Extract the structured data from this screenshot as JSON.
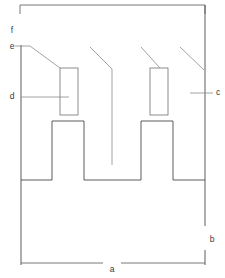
{
  "figure": {
    "type": "engineering-cross-section",
    "canvas": {
      "width": 225,
      "height": 278,
      "background": "#ffffff"
    },
    "line_color": "#4a4a4a",
    "leader_color": "#8a8a8a",
    "dimension_color": "#6a6a6a"
  },
  "labels": {
    "a": {
      "text": "a",
      "x": 112,
      "y": 270,
      "refers_to": "overall-width-dimension"
    },
    "b": {
      "text": "b",
      "x": 212,
      "y": 240,
      "refers_to": "overall-height-dimension"
    },
    "c": {
      "text": "c",
      "x": 218,
      "y": 93,
      "refers_to": "right-side-region"
    },
    "d": {
      "text": "d",
      "x": 12,
      "y": 97,
      "refers_to": "left-detail-rectangle"
    },
    "e": {
      "text": "e",
      "x": 12,
      "y": 47,
      "refers_to": "upper-surface-feature"
    },
    "f": {
      "text": "f",
      "x": 12,
      "y": 31,
      "refers_to": "top-edge-feature"
    }
  },
  "geometry": {
    "top_dimension_line": {
      "x1": 20,
      "y1": 5,
      "x2": 205,
      "y2": 5
    },
    "top_dimension_tick_left": {
      "x": 20,
      "y1": 5,
      "y2": 14
    },
    "top_dimension_tick_right": {
      "x": 205,
      "y1": 5,
      "y2": 14
    },
    "left_vertical": {
      "x": 21,
      "y1": 45,
      "y2": 265
    },
    "right_vertical_upper": {
      "x": 205,
      "y1": 5,
      "y2": 226
    },
    "right_vertical_lower": {
      "x": 205,
      "y1": 250,
      "y2": 265
    },
    "profile_path": "M 21 180 L 52 180 L 52 121 L 84 121 L 84 180 L 141 180 L 141 121 L 173 121 L 173 180 L 205 180",
    "left_detail_rect": {
      "x": 60,
      "y": 68,
      "width": 18,
      "height": 47
    },
    "right_detail_rect": {
      "x": 150,
      "y": 68,
      "width": 18,
      "height": 47
    },
    "leader_e": "M 21 46 L 28 46 M 28 46 L 60 68",
    "leader_d": "M 21 97 L 69 97",
    "leader_center": "M 90 47 L 112 69 L 112 165",
    "leader_right_diag": "M 180 47 L 204 70",
    "leader_c": "M 190 93 L 213 93",
    "leader_right_tooth": "M 141 47 L 160 68",
    "bottom_dim_line_left": {
      "x1": 21,
      "y1": 263,
      "x2": 103,
      "y2": 263
    },
    "bottom_dim_line_right": {
      "x1": 121,
      "y1": 263,
      "x2": 205,
      "y2": 263
    },
    "tick_e_mark": {
      "x1": 15,
      "y1": 46,
      "x2": 28,
      "y2": 46
    }
  },
  "chart_data": {
    "type": "line",
    "xlabel": "a",
    "ylabel": "b",
    "legend_entries": [
      "a",
      "b",
      "c",
      "d",
      "e",
      "f"
    ],
    "annotations": [
      "a — overall width dimension (bottom)",
      "b — overall height dimension (right)",
      "c — right side region callout",
      "d — left detail rectangle callout",
      "e — upper surface feature callout",
      "f — top edge feature callout"
    ],
    "x": [
      21,
      52,
      52,
      84,
      84,
      141,
      141,
      173,
      173,
      205
    ],
    "values": [
      180,
      180,
      121,
      121,
      180,
      180,
      121,
      121,
      180,
      180
    ],
    "xlim": [
      0,
      225
    ],
    "ylim": [
      278,
      0
    ],
    "grid": false
  }
}
